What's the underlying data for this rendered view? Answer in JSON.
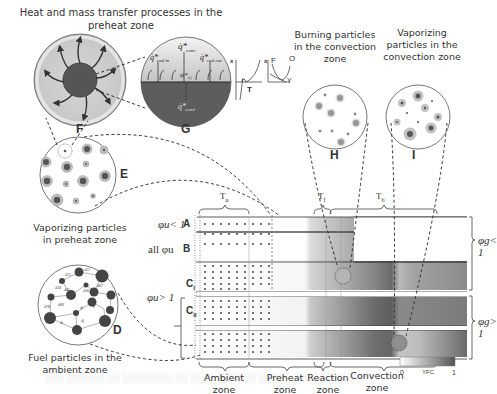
{
  "figure": {
    "title_F_G": "Heat and mass transfer processes in the preheat zone",
    "panels": {
      "D": {
        "letter": "D",
        "caption": "Fuel particles in the ambient zone"
      },
      "E": {
        "letter": "E",
        "caption": "Vaporizing particles in preheat zone"
      },
      "F": {
        "letter": "F"
      },
      "G": {
        "letter": "G",
        "labels": [
          "q*rad in",
          "q*conv",
          "q*rad out",
          "ψ*v,i",
          "q*cond"
        ]
      },
      "H": {
        "letter": "H",
        "caption": "Burning particles in the convection zone"
      },
      "I": {
        "letter": "I",
        "caption": "Vaporizing particles in the convection zone"
      }
    },
    "profile_plots": {
      "plot1": {
        "y_axis": "x",
        "x_axis": "T"
      },
      "plot2": {
        "y_axis": "x",
        "labels": [
          "F",
          "O",
          "Y"
        ]
      }
    },
    "temperature_labels": {
      "Tu": "T",
      "Tu_sub": "u",
      "Tf": "T",
      "Tf_sub": "f",
      "Tb": "T",
      "Tb_sub": "b"
    },
    "rows": [
      {
        "id": "A",
        "condition": "φu< 1",
        "label": "A"
      },
      {
        "id": "B",
        "condition": "all φu",
        "label": "B"
      },
      {
        "id": "CI",
        "label": "C",
        "sub": "I"
      },
      {
        "id": "CII",
        "label": "C",
        "sub": "II"
      }
    ],
    "group_condition_C": "φu> 1",
    "right_conditions": [
      "φg< 1",
      "φg> 1"
    ],
    "zones": [
      "Ambient zone",
      "Preheat zone",
      "Reaction zone",
      "Convection zone"
    ],
    "colorbar": {
      "min": "0",
      "label": "YFC",
      "max": "1",
      "from_color": "#ffffff",
      "to_color": "#555555"
    }
  },
  "background_text": [
    "ambient zone",
    "convection zone",
    "The particles ... Fig."
  ]
}
